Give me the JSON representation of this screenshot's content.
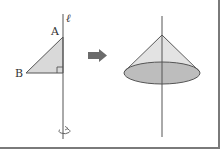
{
  "figure": {
    "left_panel": {
      "axis_label": "ℓ",
      "vertex_labels": {
        "A": "A",
        "B": "B"
      },
      "right_angle_marker": true,
      "rotation_symbol": true,
      "fill_color": "#d9d9d9"
    },
    "arrow": {
      "color": "#6b6b6b",
      "direction": "right"
    },
    "right_panel": {
      "shape": "cone",
      "body_fill": "#e3e3e3",
      "base_fill": "#bdbdbd"
    },
    "colors": {
      "stroke": "#555555",
      "border": "#7a7a7a"
    }
  }
}
